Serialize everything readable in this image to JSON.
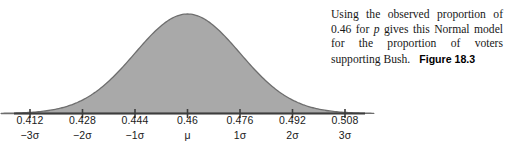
{
  "figure": {
    "caption": {
      "sentence_part1": "Using the observed proportion of 0.46 for ",
      "variable": "p",
      "sentence_part2": " gives this Normal model for the proportion of voters supporting Bush.",
      "figure_number": "Figure 18.3"
    }
  },
  "chart_data": {
    "type": "line",
    "title": "",
    "subtitle": "",
    "xlabel": "",
    "ylabel": "",
    "curve": "normal-distribution",
    "shaded": true,
    "grid": false,
    "legend": null,
    "mean": 0.46,
    "sigma": 0.016,
    "xlim": [
      0.404,
      0.516
    ],
    "ylim": [
      0,
      1
    ],
    "axis_ticks": [
      {
        "value_label": "0.412",
        "sigma_label": "−3σ",
        "x": 0.412,
        "z": -3
      },
      {
        "value_label": "0.428",
        "sigma_label": "−2σ",
        "x": 0.428,
        "z": -2
      },
      {
        "value_label": "0.444",
        "sigma_label": "−1σ",
        "x": 0.444,
        "z": -1
      },
      {
        "value_label": "0.46",
        "sigma_label": "μ",
        "x": 0.46,
        "z": 0
      },
      {
        "value_label": "0.476",
        "sigma_label": "1σ",
        "x": 0.476,
        "z": 1
      },
      {
        "value_label": "0.492",
        "sigma_label": "2σ",
        "x": 0.492,
        "z": 2
      },
      {
        "value_label": "0.508",
        "sigma_label": "3σ",
        "x": 0.508,
        "z": 3
      }
    ],
    "colors": {
      "fill": "#a9a9a9",
      "outline": "#6e6e6e",
      "axis": "#3d3d3d",
      "text": "#1a1a1a",
      "background": "#ffffff"
    }
  }
}
